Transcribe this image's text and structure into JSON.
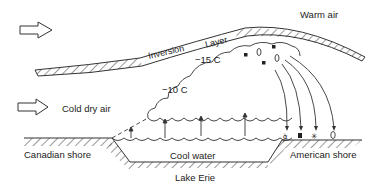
{
  "labels": {
    "warm_air": "Warm air",
    "inversion": "Inversion",
    "layer": "Layer",
    "temp_minus15": "−15 C",
    "temp_minus10": "−10 C",
    "cold_dry_air": "Cold dry air",
    "canadian_shore": "Canadian shore",
    "cool_water": "Cool water",
    "lake_erie": "Lake Erie",
    "american_shore": "American shore"
  },
  "icons": {
    "wind_arrow_top": "hollow-right-arrow",
    "wind_arrow_bottom": "hollow-right-arrow",
    "precip_symbols": [
      "dendrite-snow",
      "graupel",
      "snowflake",
      "ice-pellet"
    ]
  },
  "colors": {
    "line": "#333333",
    "text": "#222222",
    "background": "#ffffff"
  }
}
